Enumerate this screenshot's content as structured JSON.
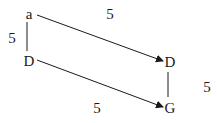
{
  "diagram": {
    "nodes": [
      {
        "id": "n1",
        "label": "a",
        "x": 29,
        "y": 14
      },
      {
        "id": "n2",
        "label": "D",
        "x": 29,
        "y": 61
      },
      {
        "id": "n3",
        "label": "D",
        "x": 170,
        "y": 62
      },
      {
        "id": "n4",
        "label": "G",
        "x": 170,
        "y": 108
      }
    ],
    "edges": [
      {
        "from": "n1",
        "to": "n2",
        "type": "line",
        "label": "5",
        "label_x": 12,
        "label_y": 38
      },
      {
        "from": "n1",
        "to": "n3",
        "type": "arrow",
        "label": "5",
        "label_x": 110,
        "label_y": 14
      },
      {
        "from": "n2",
        "to": "n4",
        "type": "arrow",
        "label": "5",
        "label_x": 97,
        "label_y": 108
      },
      {
        "from": "n3",
        "to": "n4",
        "type": "line",
        "label": "5",
        "label_x": 207,
        "label_y": 87
      }
    ],
    "colors": {
      "stroke": "#1a1a1a",
      "background": "#ffffff"
    }
  }
}
